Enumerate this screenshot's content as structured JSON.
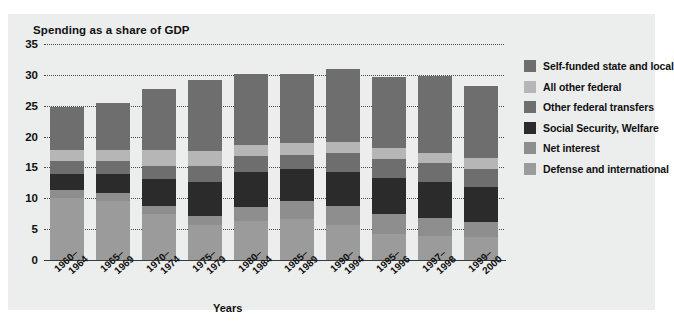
{
  "chart_data": {
    "type": "bar",
    "subtype": "stacked-vertical",
    "title": "Spending as a share of GDP",
    "xlabel": "Years",
    "ylabel": "",
    "ylim": [
      0,
      35
    ],
    "yticks": [
      0,
      5,
      10,
      15,
      20,
      25,
      30,
      35
    ],
    "grid": true,
    "legend_position": "right",
    "categories": [
      "1960–1964",
      "1965–1969",
      "1970–1974",
      "1975–1979",
      "1980–1984",
      "1985–1989",
      "1990–1994",
      "1995–1996",
      "1997–1998",
      "1999–2000"
    ],
    "category_lines": [
      [
        "1960–",
        "1964"
      ],
      [
        "1965–",
        "1969"
      ],
      [
        "1970–",
        "1974"
      ],
      [
        "1975–",
        "1979"
      ],
      [
        "1980–",
        "1984"
      ],
      [
        "1985–",
        "1989"
      ],
      [
        "1990–",
        "1994"
      ],
      [
        "1995–",
        "1996"
      ],
      [
        "1997–",
        "1998"
      ],
      [
        "1999–",
        "2000"
      ]
    ],
    "stack_order_bottom_to_top": [
      "Defense and international",
      "Net interest",
      "Social Security, Welfare",
      "Other federal transfers",
      "All other federal",
      "Self-funded state and local"
    ],
    "series": [
      {
        "name": "Defense and international",
        "color": "#9b9b9b",
        "values": [
          10.0,
          9.6,
          7.4,
          5.7,
          6.4,
          6.6,
          5.6,
          4.2,
          3.9,
          3.8
        ]
      },
      {
        "name": "Net interest",
        "color": "#8e8e8e",
        "values": [
          1.3,
          1.3,
          1.3,
          1.4,
          2.2,
          3.0,
          3.1,
          3.2,
          2.9,
          2.4
        ]
      },
      {
        "name": "Social Security, Welfare",
        "color": "#2b2b2b",
        "values": [
          2.7,
          3.1,
          4.4,
          5.6,
          5.6,
          5.1,
          5.6,
          5.9,
          5.9,
          5.7
        ]
      },
      {
        "name": "Other federal transfers",
        "color": "#6e6e6e",
        "values": [
          2.0,
          2.0,
          2.2,
          2.6,
          2.6,
          2.4,
          3.0,
          3.1,
          3.0,
          2.9
        ]
      },
      {
        "name": "All other federal",
        "color": "#b6b6b6",
        "values": [
          1.8,
          1.9,
          2.5,
          2.4,
          1.9,
          1.8,
          1.8,
          1.7,
          1.7,
          1.7
        ]
      },
      {
        "name": "Self-funded state and local",
        "color": "#6e6e6e",
        "values": [
          7.0,
          7.5,
          9.9,
          11.5,
          11.5,
          11.3,
          11.8,
          11.5,
          12.4,
          11.7
        ]
      }
    ],
    "totals": [
      24.8,
      25.4,
      27.7,
      29.2,
      30.2,
      30.2,
      30.9,
      29.6,
      29.8,
      28.2
    ],
    "legend_entries": [
      {
        "label": "Self-funded state and local",
        "color": "#6e6e6e"
      },
      {
        "label": "All other federal",
        "color": "#b6b6b6"
      },
      {
        "label": "Other federal transfers",
        "color": "#6e6e6e"
      },
      {
        "label": "Social Security, Welfare",
        "color": "#2b2b2b"
      },
      {
        "label": "Net interest",
        "color": "#8e8e8e"
      },
      {
        "label": "Defense and international",
        "color": "#9b9b9b"
      }
    ]
  },
  "colors": {
    "panel_background": "#eceded",
    "page_background": "#ffffff",
    "axis": "#3a3a3a",
    "gridline": "#4a4a4a",
    "text": "#111111"
  }
}
